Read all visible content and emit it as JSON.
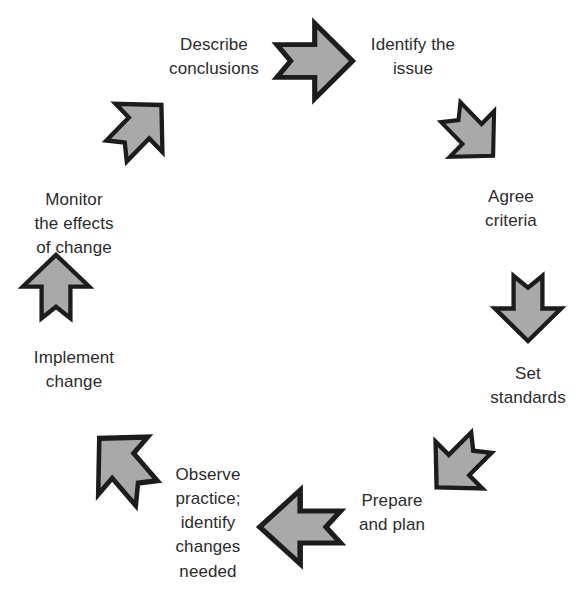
{
  "diagram": {
    "type": "cycle-diagram",
    "direction": "clockwise",
    "colors": {
      "arrow_fill": "#a9a9a9",
      "arrow_outline": "#1c1c1c",
      "text": "#2b2b2b",
      "background": "#ffffff"
    },
    "steps": [
      {
        "id": "identify-the-issue",
        "label": "Identify the\nissue",
        "order": 1,
        "position": "top-right",
        "arrow": {
          "name": "arrow-right",
          "direction": "right",
          "angle_deg": 0,
          "points_to": "identify-the-issue"
        }
      },
      {
        "id": "agree-criteria",
        "label": "Agree\ncriteria",
        "order": 2,
        "position": "right-upper",
        "arrow": {
          "name": "arrow-down-right",
          "direction": "down-right",
          "angle_deg": 45,
          "points_to": "agree-criteria"
        }
      },
      {
        "id": "set-standards",
        "label": "Set\nstandards",
        "order": 3,
        "position": "right",
        "arrow": {
          "name": "arrow-down",
          "direction": "down",
          "angle_deg": 90,
          "points_to": "set-standards"
        }
      },
      {
        "id": "prepare-and-plan",
        "label": "Prepare\nand plan",
        "order": 4,
        "position": "bottom-right",
        "arrow": {
          "name": "arrow-down-left",
          "direction": "down-left",
          "angle_deg": 135,
          "points_to": "prepare-and-plan"
        }
      },
      {
        "id": "observe-practice",
        "label": "Observe\npractice;\nidentify\nchanges\nneeded",
        "order": 5,
        "position": "bottom-center",
        "arrow": {
          "name": "arrow-left",
          "direction": "left",
          "angle_deg": 180,
          "points_to": "observe-practice"
        }
      },
      {
        "id": "implement-change",
        "label": "Implement\nchange",
        "order": 6,
        "position": "bottom-left",
        "arrow": {
          "name": "arrow-up-left",
          "direction": "up-left",
          "angle_deg": 225,
          "points_to": "implement-change"
        }
      },
      {
        "id": "monitor-the-effects-of-change",
        "label": "Monitor\nthe effects\nof change",
        "order": 7,
        "position": "left",
        "arrow": {
          "name": "arrow-up",
          "direction": "up",
          "angle_deg": 270,
          "points_to": "monitor-the-effects-of-change"
        }
      },
      {
        "id": "describe-conclusions",
        "label": "Describe\nconclusions",
        "order": 8,
        "position": "top-left",
        "arrow": {
          "name": "arrow-up-right",
          "direction": "up-right",
          "angle_deg": 315,
          "points_to": "describe-conclusions"
        }
      }
    ]
  }
}
